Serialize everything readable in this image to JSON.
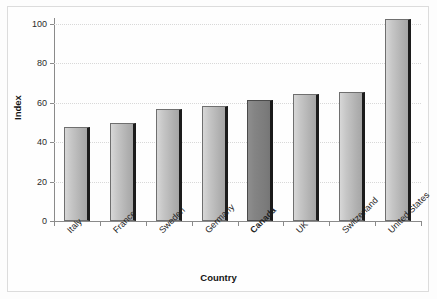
{
  "chart_data": {
    "type": "bar",
    "title": "",
    "subtitle": "",
    "xlabel": "Country",
    "ylabel": "Index",
    "categories": [
      "Italy",
      "France",
      "Sweden",
      "Germany",
      "Canada",
      "UK",
      "Switzerland",
      "United States"
    ],
    "values": [
      47.5,
      50,
      57,
      58.5,
      61.5,
      64.5,
      65.5,
      102.5
    ],
    "highlight_category": "Canada",
    "ylim": [
      0,
      100
    ],
    "yticks": [
      0,
      20,
      40,
      60,
      80,
      100
    ],
    "ytick_labels": [
      "0",
      "20",
      "40",
      "60",
      "80",
      "100"
    ],
    "grid": true,
    "grid_axis": "y",
    "legend": "none",
    "orientation": "vertical",
    "bar_color": "#c6c6c6",
    "highlight_bar_color": "#848484",
    "bar_edge_color": "#6f6f6f",
    "axis_color": "#8a8a8a",
    "grid_color": "#d8d8d8",
    "background_color": "#fefefe",
    "frame_color": "#dcdcdc"
  }
}
